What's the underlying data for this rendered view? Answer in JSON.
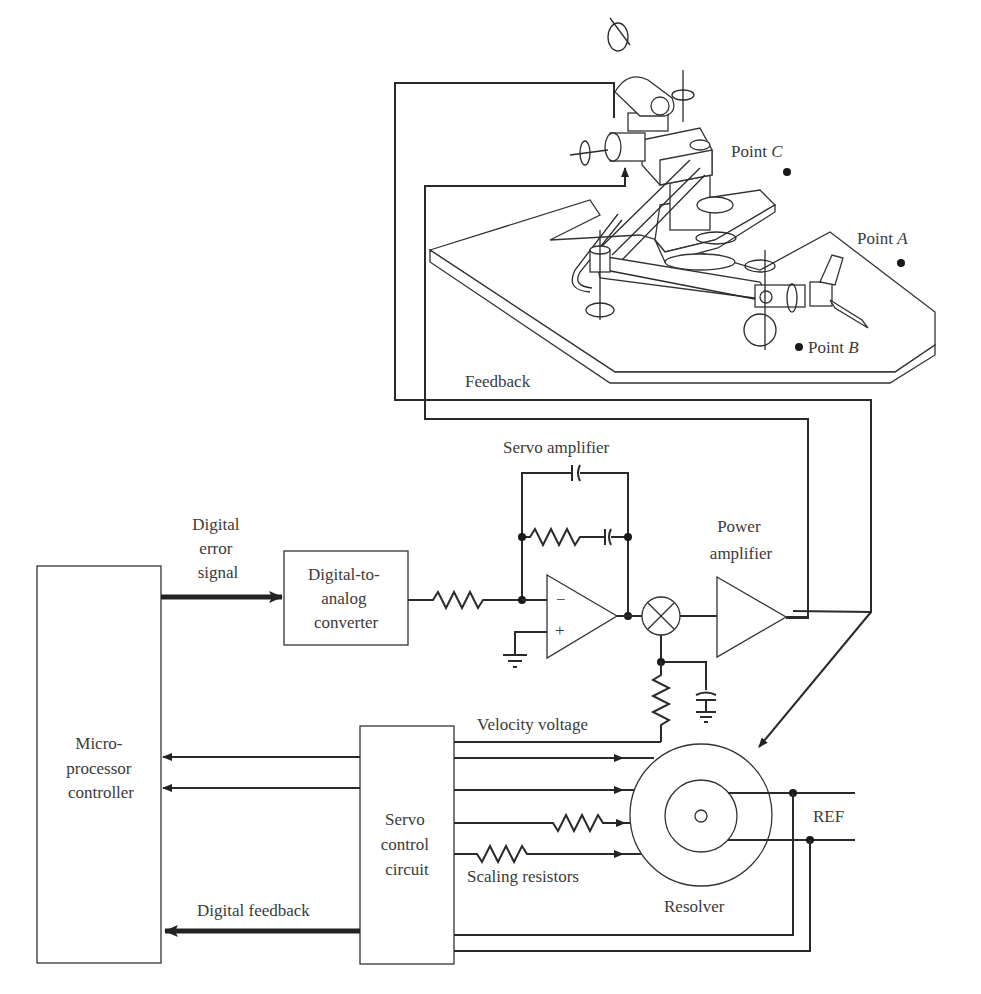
{
  "diagram": {
    "robot": {
      "points": [
        {
          "label": "Point",
          "letter": "C"
        },
        {
          "label": "Point",
          "letter": "A"
        },
        {
          "label": "Point",
          "letter": "B"
        }
      ],
      "feedback_label": "Feedback"
    },
    "blocks": {
      "microprocessor": [
        "Micro-",
        "processor",
        "controller"
      ],
      "dac": [
        "Digital-to-",
        "analog",
        "converter"
      ],
      "servo_control": [
        "Servo",
        "control",
        "circuit"
      ]
    },
    "labels": {
      "digital_error": [
        "Digital",
        "error",
        "signal"
      ],
      "servo_amplifier": "Servo amplifier",
      "power_amplifier": [
        "Power",
        "amplifier"
      ],
      "velocity_voltage": "Velocity voltage",
      "scaling_resistors": "Scaling resistors",
      "resolver": "Resolver",
      "ref": "REF",
      "digital_feedback": "Digital feedback",
      "opamp_minus": "−",
      "opamp_plus": "+"
    },
    "colors": {
      "line": "#2a2a2a",
      "text": "#3a3a3a",
      "background": "#ffffff"
    }
  }
}
